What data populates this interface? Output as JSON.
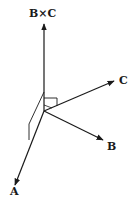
{
  "diagram": {
    "labels": {
      "cross": "B×C",
      "a": "A",
      "b": "B",
      "c": "C"
    },
    "colors": {
      "stroke": "#1a1a1a",
      "background": "#ffffff"
    }
  }
}
